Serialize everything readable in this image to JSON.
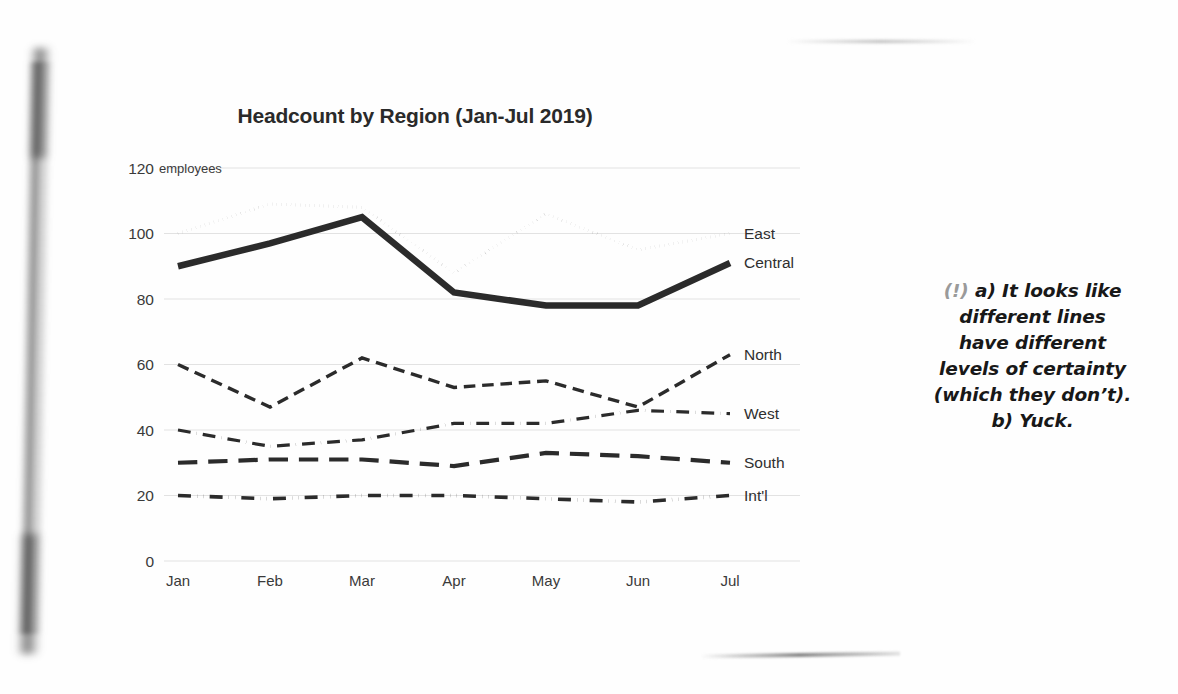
{
  "chart_data": {
    "type": "line",
    "title": "Headcount by Region (Jan-Jul 2019)",
    "xlabel": "",
    "ylabel": "employees",
    "unit_label": "employees",
    "categories": [
      "Jan",
      "Feb",
      "Mar",
      "Apr",
      "May",
      "Jun",
      "Jul"
    ],
    "yticks": [
      0,
      20,
      40,
      60,
      80,
      100,
      120
    ],
    "ylim": [
      0,
      120
    ],
    "grid": "horizontal",
    "legend_position": "right-of-line-end",
    "series": [
      {
        "name": "East",
        "values": [
          100,
          109,
          108,
          88,
          106,
          95,
          100
        ],
        "style": "dotted",
        "width": 3.2
      },
      {
        "name": "Central",
        "values": [
          90,
          97,
          105,
          82,
          78,
          78,
          91
        ],
        "style": "solid",
        "width": 6.5
      },
      {
        "name": "North",
        "values": [
          60,
          47,
          62,
          53,
          55,
          47,
          63
        ],
        "style": "dashed",
        "width": 3.4
      },
      {
        "name": "West",
        "values": [
          40,
          35,
          37,
          42,
          42,
          46,
          45
        ],
        "style": "dashdot",
        "width": 3.2
      },
      {
        "name": "South",
        "values": [
          30,
          31,
          31,
          29,
          33,
          32,
          30
        ],
        "style": "longdash",
        "width": 4.2
      },
      {
        "name": "Int'l",
        "values": [
          20,
          19,
          20,
          20,
          19,
          18,
          20
        ],
        "style": "dashdotdot",
        "width": 3.6
      }
    ]
  },
  "annotation": {
    "marker": "(!)",
    "lines": [
      "a) It looks like",
      "different lines",
      "have different",
      "levels of certainty",
      "(which they don’t).",
      "b) Yuck."
    ]
  }
}
